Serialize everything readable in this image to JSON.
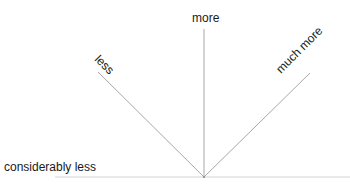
{
  "diagram": {
    "labels": {
      "less": "less",
      "more": "more",
      "much_more": "much more",
      "considerably_less": "considerably less"
    },
    "line_color": "#b0b0b0",
    "text_color": "#1a1a1a"
  }
}
